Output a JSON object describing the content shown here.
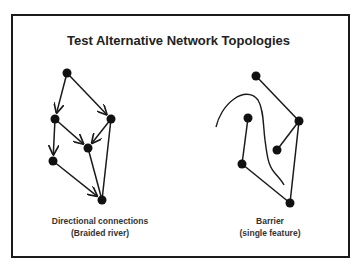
{
  "title": "Test Alternative Network Topologies",
  "colors": {
    "line": "#1a1a1a",
    "node": "#111111",
    "frame": "#1a1a1a"
  },
  "diagrams": [
    {
      "name": "directional",
      "caption_line1": "Directional connections",
      "caption_line2": "(Braided river)",
      "nodes": [
        {
          "id": "A",
          "x": 67,
          "y": 73
        },
        {
          "id": "B",
          "x": 55,
          "y": 119
        },
        {
          "id": "C",
          "x": 111,
          "y": 119
        },
        {
          "id": "D",
          "x": 88,
          "y": 148
        },
        {
          "id": "E",
          "x": 53,
          "y": 161
        },
        {
          "id": "F",
          "x": 102,
          "y": 200
        }
      ],
      "edges": [
        {
          "from": "A",
          "to": "B",
          "directed": true
        },
        {
          "from": "A",
          "to": "C",
          "directed": true
        },
        {
          "from": "B",
          "to": "D",
          "directed": true
        },
        {
          "from": "C",
          "to": "D",
          "directed": true
        },
        {
          "from": "B",
          "to": "E",
          "directed": true
        },
        {
          "from": "E",
          "to": "F",
          "directed": true
        },
        {
          "from": "D",
          "to": "F",
          "directed": false
        },
        {
          "from": "C",
          "to": "F",
          "directed": false
        }
      ]
    },
    {
      "name": "barrier",
      "caption_line1": "Barrier",
      "caption_line2": "(single feature)",
      "nodes": [
        {
          "id": "G",
          "x": 256,
          "y": 76
        },
        {
          "id": "H",
          "x": 299,
          "y": 121
        },
        {
          "id": "I",
          "x": 248,
          "y": 118
        },
        {
          "id": "J",
          "x": 277,
          "y": 150
        },
        {
          "id": "K",
          "x": 242,
          "y": 164
        },
        {
          "id": "L",
          "x": 290,
          "y": 203
        }
      ],
      "edges": [
        {
          "from": "G",
          "to": "H",
          "directed": false
        },
        {
          "from": "H",
          "to": "J",
          "directed": false
        },
        {
          "from": "H",
          "to": "L",
          "directed": false
        },
        {
          "from": "I",
          "to": "K",
          "directed": false
        },
        {
          "from": "K",
          "to": "L",
          "directed": false
        }
      ],
      "barrier_path": "M216,127 C218,118 224,106 234,99 C242,93 252,92 258,100 C264,110 263,125 265,140 C267,155 268,165 274,172 C279,178 282,181 284,185"
    }
  ]
}
